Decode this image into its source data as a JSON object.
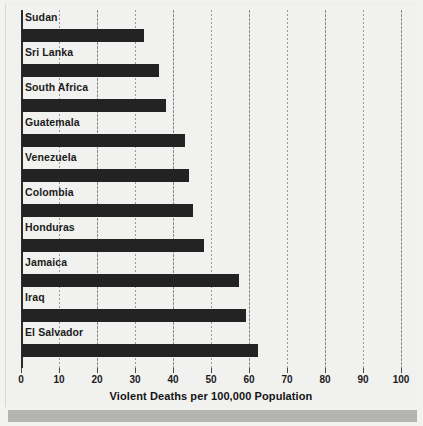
{
  "chart_data": {
    "type": "bar",
    "orientation": "horizontal",
    "title": "",
    "xlabel": "Violent Deaths per 100,000 Population",
    "ylabel": "",
    "xlim": [
      0,
      100
    ],
    "xticks": [
      0,
      10,
      20,
      30,
      40,
      50,
      60,
      70,
      80,
      90,
      100
    ],
    "xtick_labels": [
      "0",
      "10",
      "20",
      "30",
      "40",
      "50",
      "60",
      "70",
      "80",
      "90",
      "100"
    ],
    "grid": "vertical-dotted",
    "legend": "none",
    "bar_color": "#232323",
    "background_color": "#f1f1ef",
    "categories": [
      "Sudan",
      "Sri Lanka",
      "South Africa",
      "Guatemala",
      "Venezuela",
      "Colombia",
      "Honduras",
      "Jamaica",
      "Iraq",
      "El Salvador"
    ],
    "values": [
      32,
      36,
      38,
      43,
      44,
      45,
      48,
      57,
      59,
      62
    ]
  }
}
